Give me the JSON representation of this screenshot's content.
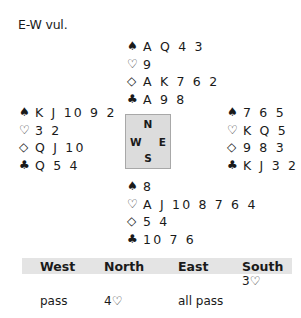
{
  "vulnerability": "E-W vul.",
  "suit_symbols": {
    "spades": "♠",
    "hearts": "♡",
    "diamonds": "◇",
    "clubs": "♣"
  },
  "hands": {
    "north": {
      "spades": "A Q 4 3",
      "hearts": "9",
      "diamonds": "A K 7 6 2",
      "clubs": "A 9 8"
    },
    "west": {
      "spades": "K J 10 9 2",
      "hearts": "3 2",
      "diamonds": "Q J 10",
      "clubs": "Q 5 4"
    },
    "east": {
      "spades": "7 6 5",
      "hearts": "K Q 5",
      "diamonds": "9 8 3",
      "clubs": "K J 3 2"
    },
    "south": {
      "spades": "8",
      "hearts": "A J 10 8 7 6 4",
      "diamonds": "5 4",
      "clubs": "10 7 6"
    }
  },
  "compass": {
    "north": "N",
    "south": "S",
    "west": "W",
    "east": "E"
  },
  "auction": {
    "headers": [
      "West",
      "North",
      "East",
      "South"
    ],
    "rows": [
      [
        "",
        "",
        "",
        "3♡"
      ],
      [
        "pass",
        "4♡",
        "all pass",
        ""
      ]
    ]
  },
  "colors": {
    "compass_bg": "#dcdcdc",
    "header_bg": "#e4e4e4",
    "text": "#1a1a1a"
  }
}
